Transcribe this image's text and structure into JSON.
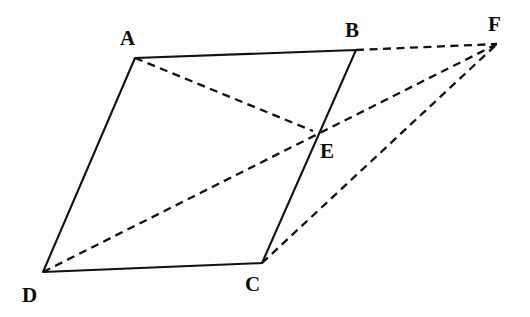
{
  "figure": {
    "name": "parallelogram-abcd-with-point-e-and-f",
    "background_color": "#fdfdfd",
    "stroke_color": "#111111",
    "width": 530,
    "height": 317
  },
  "points": {
    "A": {
      "label": "A",
      "x": 135,
      "y": 58,
      "label_x": 120,
      "label_y": 28
    },
    "B": {
      "label": "B",
      "x": 356,
      "y": 50,
      "label_x": 345,
      "label_y": 20
    },
    "C": {
      "label": "C",
      "x": 262,
      "y": 263,
      "label_x": 245,
      "label_y": 274
    },
    "D": {
      "label": "D",
      "x": 43,
      "y": 272,
      "label_x": 22,
      "label_y": 285
    },
    "E": {
      "label": "E",
      "x": 313,
      "y": 131,
      "label_x": 320,
      "label_y": 141
    },
    "F": {
      "label": "F",
      "x": 497,
      "y": 44,
      "label_x": 488,
      "label_y": 14
    }
  },
  "edges": {
    "solid": [
      {
        "name": "segment-ab",
        "from": "A",
        "to": "B"
      },
      {
        "name": "segment-bc",
        "from": "B",
        "to": "C"
      },
      {
        "name": "segment-cd",
        "from": "C",
        "to": "D"
      },
      {
        "name": "segment-da",
        "from": "D",
        "to": "A"
      }
    ],
    "dashed": [
      {
        "name": "segment-bf",
        "from": "B",
        "to": "F"
      },
      {
        "name": "segment-cf",
        "from": "C",
        "to": "F"
      },
      {
        "name": "segment-df",
        "from": "D",
        "to": "F"
      },
      {
        "name": "segment-ae",
        "from": "A",
        "to": "E"
      }
    ]
  },
  "paths": {
    "quadrilateral": "M 135 58 L 356 50 L 262 263 L 43 272 Z",
    "dashed_bf": "M 356 50 L 497 44",
    "dashed_cf": "M 262 263 L 497 44",
    "dashed_df": "M 43 272 L 497 44",
    "dashed_ae": "M 135 58 L 313 131"
  }
}
